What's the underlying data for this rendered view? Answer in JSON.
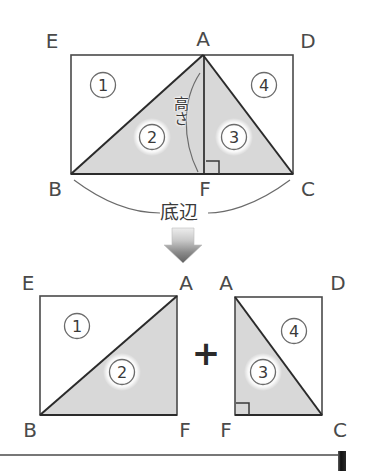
{
  "figure": {
    "title_alt": "triangle area decomposition diagram",
    "annotations": {
      "height_label": "高さ",
      "base_label": "底辺",
      "plus_sign": "+"
    },
    "colors": {
      "shade": "#d6d6d6",
      "stroke": "#2f2f2f",
      "thin_stroke": "#6b6b6b",
      "text": "#3a3a3a",
      "arrow_dark": "#6e6e6e",
      "arrow_light": "#e2e2e2",
      "bar_dark": "#1a1a1a"
    },
    "top_diagram": {
      "name": "rectangle-EBCD-with-triangle-ABC",
      "vertex_labels": {
        "E": "E",
        "A": "A",
        "D": "D",
        "B": "B",
        "F": "F",
        "C": "C"
      },
      "regions": [
        {
          "id": "1",
          "label": "①",
          "shaded": false
        },
        {
          "id": "2",
          "label": "②",
          "shaded": true
        },
        {
          "id": "3",
          "label": "③",
          "shaded": true
        },
        {
          "id": "4",
          "label": "④",
          "shaded": false
        }
      ]
    },
    "bottom_left_diagram": {
      "name": "square-EBFA",
      "vertex_labels": {
        "E": "E",
        "A": "A",
        "B": "B",
        "F": "F"
      },
      "regions": [
        {
          "id": "1",
          "label": "①",
          "shaded": false
        },
        {
          "id": "2",
          "label": "②",
          "shaded": true
        }
      ]
    },
    "bottom_right_diagram": {
      "name": "square-AFCD",
      "vertex_labels": {
        "A": "A",
        "D": "D",
        "F": "F",
        "C": "C"
      },
      "regions": [
        {
          "id": "4",
          "label": "④",
          "shaded": false
        },
        {
          "id": "3",
          "label": "③",
          "shaded": true
        }
      ]
    }
  }
}
